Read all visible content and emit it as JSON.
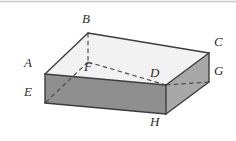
{
  "figure": {
    "type": "3d-geometry-diagram",
    "projection": "oblique",
    "background_color": "#ffffff",
    "top_rule_color": "#c8c8c8",
    "colors": {
      "top_face": "#f2f2f2",
      "front_face": "#8f8f8f",
      "right_face": "#a8a8a8",
      "edge_stroke": "#3d3d3d",
      "hidden_edge_stroke": "#4a4a4a",
      "label_text": "#2e2e2e"
    },
    "vertices": [
      {
        "id": "A",
        "label": "A",
        "x": 45,
        "y": 74,
        "label_x": 24,
        "label_y": 56,
        "hidden": false
      },
      {
        "id": "B",
        "label": "B",
        "x": 88,
        "y": 33,
        "label_x": 82,
        "label_y": 12,
        "hidden": false
      },
      {
        "id": "C",
        "label": "C",
        "x": 209,
        "y": 53,
        "label_x": 214,
        "label_y": 35,
        "hidden": false
      },
      {
        "id": "D",
        "label": "D",
        "x": 166,
        "y": 85,
        "label_x": 150,
        "label_y": 66,
        "hidden": false
      },
      {
        "id": "E",
        "label": "E",
        "x": 45,
        "y": 103,
        "label_x": 24,
        "label_y": 85,
        "hidden": false
      },
      {
        "id": "F",
        "label": "F",
        "x": 88,
        "y": 62,
        "label_x": 84,
        "label_y": 60,
        "hidden": true
      },
      {
        "id": "G",
        "label": "G",
        "x": 209,
        "y": 82,
        "label_x": 214,
        "label_y": 64,
        "hidden": false
      },
      {
        "id": "H",
        "label": "H",
        "x": 166,
        "y": 114,
        "label_x": 150,
        "label_y": 115,
        "hidden": false
      }
    ],
    "solid_edges": [
      {
        "name": "edge-A-B",
        "from": "A",
        "to": "B"
      },
      {
        "name": "edge-B-C",
        "from": "B",
        "to": "C"
      },
      {
        "name": "edge-C-D",
        "from": "C",
        "to": "D"
      },
      {
        "name": "edge-D-A",
        "from": "D",
        "to": "A"
      },
      {
        "name": "edge-A-E",
        "from": "A",
        "to": "E"
      },
      {
        "name": "edge-C-G",
        "from": "C",
        "to": "G"
      },
      {
        "name": "edge-D-H",
        "from": "D",
        "to": "H"
      },
      {
        "name": "edge-E-H",
        "from": "E",
        "to": "H"
      },
      {
        "name": "edge-H-G",
        "from": "H",
        "to": "G"
      }
    ],
    "hidden_edges": [
      {
        "name": "edge-B-F",
        "from": "B",
        "to": "F"
      },
      {
        "name": "edge-F-D",
        "from": "F",
        "to": "D"
      },
      {
        "name": "edge-E-F",
        "from": "E",
        "to": "F"
      },
      {
        "name": "edge-D-G",
        "from": "D",
        "to": "G"
      }
    ],
    "faces": [
      {
        "name": "top-face",
        "path": "A B C D",
        "fill_key": "top_face"
      },
      {
        "name": "front-face",
        "path": "A D H E",
        "fill_key": "front_face"
      },
      {
        "name": "right-face",
        "path": "D C G H",
        "fill_key": "right_face"
      }
    ]
  }
}
